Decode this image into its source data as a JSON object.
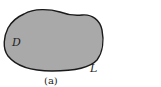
{
  "figure": {
    "region_label": "D",
    "boundary_label": "L",
    "caption": "(a)"
  },
  "colors": {
    "region_fill": "#a9a9a9",
    "boundary_stroke": "#1a1a1a",
    "background": "#ffffff"
  }
}
